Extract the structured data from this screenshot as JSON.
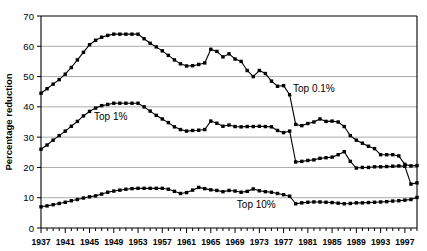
{
  "chart_data": {
    "type": "line",
    "title": "",
    "xlabel": "",
    "ylabel": "Percentage reduction",
    "xlim": [
      1937,
      1999
    ],
    "ylim": [
      0,
      70
    ],
    "ytick_values": [
      0,
      10,
      20,
      30,
      40,
      50,
      60,
      70
    ],
    "ytick_labels": [
      "0",
      "10",
      "20",
      "30",
      "40",
      "50",
      "60",
      "70"
    ],
    "xtick_labels": [
      "1937",
      "1941",
      "1945",
      "1949",
      "1953",
      "1957",
      "1961",
      "1965",
      "1969",
      "1973",
      "1977",
      "1981",
      "1985",
      "1989",
      "1993",
      "1997"
    ],
    "xtick_values": [
      1937,
      1941,
      1945,
      1949,
      1953,
      1957,
      1961,
      1965,
      1969,
      1973,
      1977,
      1981,
      1985,
      1989,
      1993,
      1997
    ],
    "grid": "horizontal",
    "legend_position": "inline-annotations",
    "marker": "square",
    "line_color": "#000000",
    "grid_color": "#aaaaaa",
    "x": [
      1937,
      1938,
      1939,
      1940,
      1941,
      1942,
      1943,
      1944,
      1945,
      1946,
      1947,
      1948,
      1949,
      1950,
      1951,
      1952,
      1953,
      1954,
      1955,
      1956,
      1957,
      1958,
      1959,
      1960,
      1961,
      1962,
      1963,
      1964,
      1965,
      1966,
      1967,
      1968,
      1969,
      1970,
      1971,
      1972,
      1973,
      1974,
      1975,
      1976,
      1977,
      1978,
      1979,
      1980,
      1981,
      1982,
      1983,
      1984,
      1985,
      1986,
      1987,
      1988,
      1989,
      1990,
      1991,
      1992,
      1993,
      1994,
      1995,
      1996,
      1997,
      1998,
      1999
    ],
    "series": [
      {
        "name": "Top 0.1%",
        "label": "Top 0.1%",
        "values": [
          44.5,
          46.0,
          47.5,
          49.0,
          50.8,
          53.0,
          55.5,
          58.0,
          60.5,
          62.0,
          63.0,
          63.6,
          64.0,
          64.0,
          64.0,
          64.0,
          64.0,
          62.5,
          61.0,
          59.8,
          58.5,
          57.0,
          55.5,
          54.2,
          53.5,
          53.6,
          54.0,
          54.5,
          59.0,
          58.3,
          56.5,
          57.5,
          55.8,
          55.0,
          52.0,
          50.0,
          52.0,
          51.0,
          48.5,
          46.8,
          47.0,
          44.0,
          34.2,
          33.8,
          34.5,
          35.0,
          36.0,
          35.2,
          35.3,
          35.0,
          33.5,
          30.5,
          29.0,
          28.0,
          27.0,
          26.2,
          24.2,
          24.2,
          24.2,
          23.8,
          21.0,
          20.5,
          20.6
        ]
      },
      {
        "name": "Top 1%",
        "label": "Top 1%",
        "values": [
          26.0,
          27.4,
          29.0,
          30.5,
          32.0,
          33.6,
          35.2,
          37.0,
          38.5,
          39.6,
          40.4,
          40.8,
          41.2,
          41.2,
          41.2,
          41.2,
          41.2,
          40.0,
          38.6,
          37.2,
          36.0,
          34.8,
          33.4,
          32.5,
          32.0,
          32.2,
          32.3,
          32.5,
          35.3,
          34.6,
          33.6,
          34.0,
          33.5,
          33.4,
          33.5,
          33.5,
          33.6,
          33.5,
          33.4,
          32.2,
          31.5,
          32.0,
          21.8,
          22.0,
          22.3,
          22.5,
          23.0,
          23.2,
          23.4,
          24.2,
          25.2,
          22.0,
          19.8,
          20.0,
          20.0,
          20.2,
          20.2,
          20.3,
          20.4,
          20.5,
          20.4,
          14.5,
          14.9
        ]
      },
      {
        "name": "Top 10%",
        "label": "Top 10%",
        "values": [
          7.0,
          7.3,
          7.7,
          8.1,
          8.5,
          9.0,
          9.4,
          9.9,
          10.3,
          10.6,
          11.2,
          11.8,
          12.2,
          12.5,
          12.8,
          13.0,
          13.1,
          13.1,
          13.1,
          13.1,
          13.1,
          12.8,
          12.1,
          11.4,
          11.7,
          12.5,
          13.4,
          13.0,
          12.6,
          12.4,
          12.0,
          12.4,
          12.2,
          11.8,
          12.1,
          12.9,
          12.3,
          12.0,
          11.8,
          11.4,
          11.0,
          10.5,
          8.0,
          8.3,
          8.5,
          8.6,
          8.6,
          8.5,
          8.4,
          8.2,
          8.0,
          8.1,
          8.3,
          8.3,
          8.4,
          8.5,
          8.6,
          8.7,
          8.9,
          9.0,
          9.2,
          9.4,
          10.1
        ]
      }
    ],
    "annotations": [
      {
        "text": "Top 0.1%",
        "x": 1982,
        "y": 45.0
      },
      {
        "text": "Top 1%",
        "x": 1948.5,
        "y": 35.5
      },
      {
        "text": "Top 10%",
        "x": 1972.5,
        "y": 6.5
      }
    ]
  }
}
